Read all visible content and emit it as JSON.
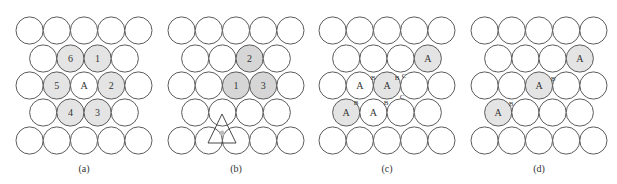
{
  "figure": {
    "geometry": {
      "radius": 13.6,
      "pitch": 27.2,
      "row_y": [
        30.5,
        58.5,
        85.5,
        112.5,
        140.5
      ],
      "caption_y": 172
    },
    "colors": {
      "stroke": "#4a4a4a",
      "fill_light": "#e4e4e4",
      "fill_dark": "#d6d6d6",
      "text": "#333333"
    },
    "panels": [
      {
        "id": "a",
        "caption": "(a)",
        "x0": 29.6,
        "shade": "shade-a",
        "shaded": [
          [
            1,
            1
          ],
          [
            1,
            2
          ],
          [
            2,
            1
          ],
          [
            2,
            3
          ],
          [
            3,
            1
          ],
          [
            3,
            2
          ]
        ],
        "labels": [
          {
            "row": 1,
            "col": 1,
            "text": "6"
          },
          {
            "row": 1,
            "col": 2,
            "text": "1"
          },
          {
            "row": 2,
            "col": 1,
            "text": "5"
          },
          {
            "row": 2,
            "col": 2,
            "text": "A"
          },
          {
            "row": 2,
            "col": 3,
            "text": "2"
          },
          {
            "row": 3,
            "col": 1,
            "text": "4"
          },
          {
            "row": 3,
            "col": 2,
            "text": "3"
          }
        ],
        "small_labels": []
      },
      {
        "id": "b",
        "caption": "(b)",
        "x0": 181.6,
        "shade": "shade-b",
        "shaded": [
          [
            1,
            2
          ],
          [
            2,
            2
          ],
          [
            2,
            3
          ]
        ],
        "labels": [
          {
            "row": 1,
            "col": 2,
            "text": "2"
          },
          {
            "row": 2,
            "col": 2,
            "text": "1"
          },
          {
            "row": 2,
            "col": 3,
            "text": "3"
          }
        ],
        "small_labels": [],
        "triangle": {
          "apex": [
            222,
            114
          ],
          "left": [
            208,
            143
          ],
          "right": [
            236,
            143
          ],
          "gap_center": [
            222,
            133
          ]
        }
      },
      {
        "id": "c",
        "caption": "(c)",
        "x0": 332.6,
        "shade": "shade-a",
        "shaded": [
          [
            1,
            3
          ],
          [
            2,
            2
          ],
          [
            3,
            0
          ]
        ],
        "labels": [
          {
            "row": 1,
            "col": 3,
            "text": "A"
          },
          {
            "row": 2,
            "col": 1,
            "text": "A"
          },
          {
            "row": 2,
            "col": 2,
            "text": "A"
          },
          {
            "row": 3,
            "col": 0,
            "text": "A"
          },
          {
            "row": 3,
            "col": 1,
            "text": "A"
          }
        ],
        "small_labels": [
          {
            "x": 373,
            "y": 78,
            "text": "B"
          },
          {
            "x": 397,
            "y": 78,
            "text": "B"
          },
          {
            "x": 404,
            "y": 76,
            "text": "C"
          },
          {
            "x": 356,
            "y": 103,
            "text": "B"
          },
          {
            "x": 386,
            "y": 103,
            "text": "B"
          },
          {
            "x": 402,
            "y": 97,
            "text": "C"
          }
        ]
      },
      {
        "id": "d",
        "caption": "(d)",
        "x0": 484.6,
        "shade": "shade-a",
        "shaded": [
          [
            1,
            3
          ],
          [
            2,
            2
          ],
          [
            3,
            0
          ]
        ],
        "labels": [
          {
            "row": 1,
            "col": 3,
            "text": "A"
          },
          {
            "row": 2,
            "col": 2,
            "text": "A"
          },
          {
            "row": 3,
            "col": 0,
            "text": "A"
          }
        ],
        "small_labels": [
          {
            "x": 553,
            "y": 79,
            "text": "B"
          },
          {
            "x": 511,
            "y": 104,
            "text": "B"
          }
        ]
      }
    ]
  }
}
